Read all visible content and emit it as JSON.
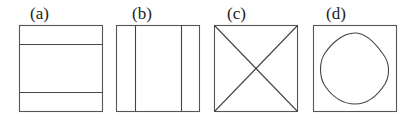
{
  "figure": {
    "panels": [
      {
        "label": "(a)",
        "description": "square with two horizontal lines"
      },
      {
        "label": "(b)",
        "description": "square with two vertical lines"
      },
      {
        "label": "(c)",
        "description": "square with both diagonals"
      },
      {
        "label": "(d)",
        "description": "square with inscribed rounded closed curve"
      }
    ]
  },
  "colors": {
    "stroke": "#555555",
    "background": "#ffffff"
  }
}
